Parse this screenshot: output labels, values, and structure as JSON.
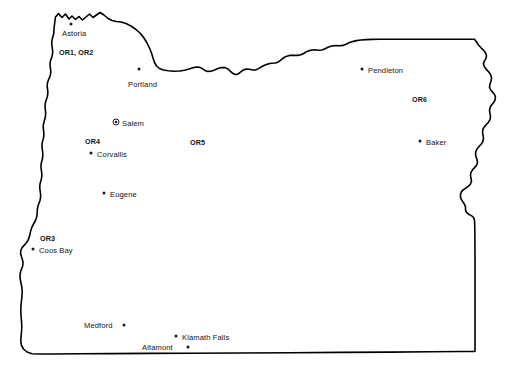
{
  "map": {
    "title": "Oregon state outline map",
    "background_color": "#ffffff",
    "outline_color": "#000000",
    "label_color": "#141414",
    "places": [
      {
        "id": "astoria",
        "name": "Astoria",
        "kind": "city",
        "marker": "dot",
        "label_x": 62,
        "label_y": 29,
        "dot_x": 71,
        "dot_y": 24
      },
      {
        "id": "portland",
        "name": "Portland",
        "kind": "city",
        "marker": "dot",
        "label_x": 128,
        "label_y": 80,
        "dot_x": 139,
        "dot_y": 69
      },
      {
        "id": "salem",
        "name": "Salem",
        "kind": "capital",
        "marker": "capital-dot",
        "label_x": 122,
        "label_y": 119,
        "dot_x": 116,
        "dot_y": 122
      },
      {
        "id": "corvallis",
        "name": "Corvallis",
        "kind": "city",
        "marker": "dot",
        "label_x": 97,
        "label_y": 150,
        "dot_x": 91,
        "dot_y": 153
      },
      {
        "id": "eugene",
        "name": "Eugene",
        "kind": "city",
        "marker": "dot",
        "label_x": 110,
        "label_y": 190,
        "dot_x": 104,
        "dot_y": 193
      },
      {
        "id": "coos-bay",
        "name": "Coos Bay",
        "kind": "city",
        "marker": "dot",
        "label_x": 39,
        "label_y": 246,
        "dot_x": 33,
        "dot_y": 249
      },
      {
        "id": "medford",
        "name": "Medford",
        "kind": "city",
        "marker": "dot-right",
        "label_x": 84,
        "label_y": 321,
        "dot_x": 124,
        "dot_y": 325
      },
      {
        "id": "klamath-falls",
        "name": "Klamath Falls",
        "kind": "city",
        "marker": "dot",
        "label_x": 182,
        "label_y": 333,
        "dot_x": 176,
        "dot_y": 336
      },
      {
        "id": "altamont",
        "name": "Altamont",
        "kind": "city",
        "marker": "dot-right",
        "label_x": 142,
        "label_y": 343,
        "dot_x": 188,
        "dot_y": 347
      },
      {
        "id": "pendleton",
        "name": "Pendleton",
        "kind": "city",
        "marker": "dot",
        "label_x": 368,
        "label_y": 66,
        "dot_x": 362,
        "dot_y": 69
      },
      {
        "id": "baker",
        "name": "Baker",
        "kind": "city",
        "marker": "dot",
        "label_x": 426,
        "label_y": 138,
        "dot_x": 420,
        "dot_y": 141
      }
    ],
    "regions": [
      {
        "id": "or1-or2",
        "name": "OR1, OR2",
        "label_x": 59,
        "label_y": 48
      },
      {
        "id": "or3",
        "name": "OR3",
        "label_x": 40,
        "label_y": 234
      },
      {
        "id": "or4",
        "name": "OR4",
        "label_x": 85,
        "label_y": 137
      },
      {
        "id": "or5",
        "name": "OR5",
        "label_x": 190,
        "label_y": 138
      },
      {
        "id": "or6",
        "name": "OR6",
        "label_x": 412,
        "label_y": 95
      }
    ]
  }
}
